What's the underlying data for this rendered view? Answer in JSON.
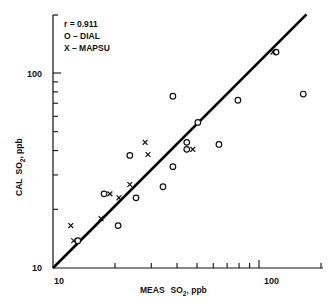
{
  "chart_data": {
    "type": "scatter",
    "title": "",
    "xlabel": "MEAS SO2, ppb",
    "ylabel": "CAL SO2, ppb",
    "xscale": "log",
    "yscale": "log",
    "xlim": [
      10,
      200
    ],
    "ylim": [
      10,
      200
    ],
    "x_tick_labels": [
      "10",
      "100"
    ],
    "y_tick_labels": [
      "10",
      "100"
    ],
    "grid": false,
    "legend_position": "upper-left",
    "annotations": [
      "r = 0.911"
    ],
    "legend": [
      {
        "marker": "o",
        "label": "O – DIAL"
      },
      {
        "marker": "x",
        "label": "X – MAPSU"
      }
    ],
    "series": [
      {
        "name": "DIAL",
        "marker": "circle",
        "points": [
          [
            13.2,
            13.8
          ],
          [
            20.7,
            16.5
          ],
          [
            17.7,
            24.0
          ],
          [
            25.3,
            22.9
          ],
          [
            23.6,
            37.8
          ],
          [
            34.2,
            26.1
          ],
          [
            38.2,
            33.1
          ],
          [
            44.6,
            40.6
          ],
          [
            44.6,
            44.1
          ],
          [
            38.2,
            76.0
          ],
          [
            50.5,
            55.8
          ],
          [
            63.9,
            43.0
          ],
          [
            79.0,
            72.5
          ],
          [
            121,
            128
          ],
          [
            164,
            78.0
          ]
        ]
      },
      {
        "name": "MAPSU",
        "marker": "x",
        "points": [
          [
            12.2,
            16.5
          ],
          [
            12.6,
            13.8
          ],
          [
            17.1,
            17.9
          ],
          [
            18.9,
            24.0
          ],
          [
            20.9,
            22.9
          ],
          [
            23.6,
            26.8
          ],
          [
            28.9,
            38.2
          ],
          [
            28.0,
            44.1
          ],
          [
            47.7,
            40.6
          ],
          [
            117,
            128
          ]
        ]
      },
      {
        "name": "1:1 line",
        "type": "line",
        "points": [
          [
            10,
            10
          ],
          [
            170,
            200
          ]
        ]
      }
    ]
  },
  "labels": {
    "r_value": "r = 0.911",
    "legend_dial": "O – DIAL",
    "legend_mapsu": "X – MAPSU",
    "x_axis_title_prefix": "MEAS",
    "y_axis_title_prefix": "CAL",
    "so": "SO",
    "sub2": "2",
    "unit": ", ppb",
    "x_tick_10": "10",
    "x_tick_100": "100",
    "y_tick_10": "10",
    "y_tick_100": "100"
  }
}
